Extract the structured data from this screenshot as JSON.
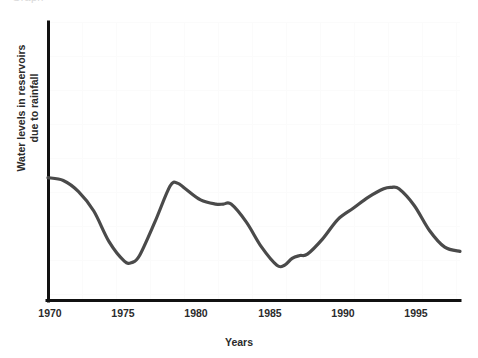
{
  "figure": {
    "clipped_header_text": "Graph",
    "background_color": "#ffffff",
    "axis_color": "#111111",
    "line_color": "#4a4a4a"
  },
  "axes": {
    "xlabel": "Years",
    "ylabel_line1": "Water levels in reservoirs",
    "ylabel_line2": "due to rainfall",
    "xticks": [
      "1970",
      "1975",
      "1980",
      "1985",
      "1990",
      "1995"
    ],
    "yticks": []
  },
  "chart_data": {
    "type": "line",
    "title": "",
    "subtitle": "",
    "xlabel": "Years",
    "ylabel": "Water levels in reservoirs due to rainfall",
    "xlim": [
      1970,
      1997
    ],
    "ylim": [
      0,
      100
    ],
    "xticks": [
      1970,
      1975,
      1980,
      1985,
      1990,
      1995
    ],
    "yticks": [],
    "grid": false,
    "legend": false,
    "legend_position": "none",
    "annotations": [],
    "series": [
      {
        "name": "Water levels in reservoirs due to rainfall",
        "color": "#4a4a4a",
        "x": [
          1970,
          1971,
          1972,
          1973,
          1974,
          1975,
          1975.5,
          1976,
          1977,
          1978,
          1978.5,
          1979,
          1980,
          1981,
          1981.5,
          1982,
          1983,
          1984,
          1985,
          1985.5,
          1986,
          1986.5,
          1987,
          1988,
          1989,
          1990,
          1991,
          1992,
          1992.5,
          1993,
          1994,
          1995,
          1996,
          1997
        ],
        "y": [
          44,
          43,
          39,
          32,
          21,
          14,
          13.5,
          16,
          28,
          41,
          42,
          40,
          36,
          34.5,
          34.5,
          34.5,
          28,
          19,
          12.5,
          12.5,
          15,
          16,
          16.5,
          22,
          29,
          33,
          37,
          40,
          40.5,
          40,
          34,
          25,
          19,
          17.5
        ]
      }
    ]
  }
}
